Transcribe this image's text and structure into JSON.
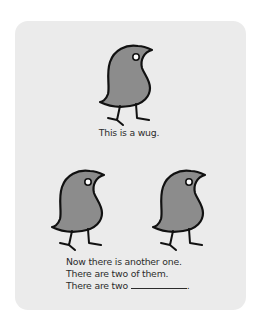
{
  "top_panel": {
    "bird_icon": "wug-bird",
    "caption": "This is a wug."
  },
  "bottom_panel": {
    "bird_icons": [
      "wug-bird",
      "wug-bird"
    ],
    "lines": [
      "Now there is another one.",
      "There are two of them.",
      "There are two"
    ],
    "blank_suffix": "."
  },
  "colors": {
    "card_background": "#ebebeb",
    "bird_fill": "#8c8c8c",
    "bird_outline": "#111111",
    "text": "#2b2b2b"
  }
}
